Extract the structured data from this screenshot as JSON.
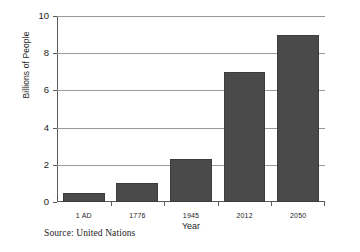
{
  "chart_data": {
    "type": "bar",
    "title": "",
    "categories": [
      "1 AD",
      "1776",
      "1945",
      "2012",
      "2050"
    ],
    "values": [
      0.5,
      1.0,
      2.3,
      7.0,
      9.0
    ],
    "xlabel": "Year",
    "ylabel": "Billions of People",
    "ylim": [
      0,
      10
    ],
    "yticks": [
      0,
      2,
      4,
      6,
      8,
      10
    ],
    "ytick_labels": [
      "0",
      "2",
      "4",
      "6",
      "8",
      "10"
    ],
    "grid": true,
    "legend": null,
    "bar_color": "#4a4a4a",
    "gridline_color": "#9a9a9a",
    "axis_color": "#5a5a5a",
    "annotations": {
      "source": "Source: United Nations"
    }
  }
}
